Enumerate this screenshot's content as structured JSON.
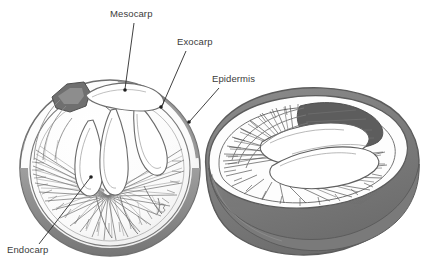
{
  "figure": {
    "background_color": "#ffffff",
    "ink_color": "#4a4a4a",
    "shade_color": "#7c7c7c",
    "dark_shade_color": "#5e5e5e",
    "light_shade_color": "#bdbdbd",
    "label_color": "#3b3b3b",
    "leader_color": "#2b2b2b"
  },
  "labels": [
    {
      "id": "mesocarp",
      "text": "Mesocarp",
      "text_x": 110,
      "text_y": 17,
      "leader": {
        "x1": 134,
        "y1": 23,
        "x2": 125,
        "y2": 89
      },
      "dot": {
        "cx": 125,
        "cy": 90,
        "r": 1.8
      }
    },
    {
      "id": "exocarp",
      "text": "Exocarp",
      "text_x": 177,
      "text_y": 45,
      "leader": {
        "x1": 186,
        "y1": 51,
        "x2": 162,
        "y2": 106
      },
      "dot": {
        "cx": 161,
        "cy": 107,
        "r": 1.8
      }
    },
    {
      "id": "epidermis",
      "text": "Epidermis",
      "text_x": 212,
      "text_y": 82,
      "leader": {
        "x1": 219,
        "y1": 88,
        "x2": 190,
        "y2": 121
      },
      "dot": {
        "cx": 189,
        "cy": 122,
        "r": 1.8
      }
    },
    {
      "id": "endocarp",
      "text": "Endocarp",
      "text_x": 7,
      "text_y": 253,
      "leader": {
        "x1": 39,
        "y1": 244,
        "x2": 90,
        "y2": 178
      },
      "dot": {
        "cx": 91,
        "cy": 177,
        "r": 1.8
      }
    }
  ],
  "specimens": [
    {
      "id": "left-half",
      "name": "cross-section-half",
      "center_x": 110,
      "center_y": 168,
      "radius_x": 90,
      "radius_y": 88
    },
    {
      "id": "right-half",
      "name": "oblique-cut-half",
      "center_x": 310,
      "center_y": 175,
      "radius_x": 110,
      "radius_y": 90
    }
  ]
}
